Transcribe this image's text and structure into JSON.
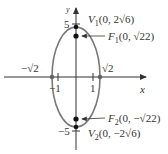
{
  "diagram": {
    "type": "ellipse",
    "equation_params": {
      "a_squared": 24,
      "b_squared": 2,
      "c_squared": 22
    },
    "axes": {
      "x_label": "x",
      "y_label": "y"
    },
    "ticks": {
      "y_pos": "5",
      "y_neg": "−5",
      "x_pos": "1",
      "x_neg": "−1"
    },
    "intercepts": {
      "x_pos": "√2",
      "x_neg": "−√2"
    },
    "labels": {
      "v1": {
        "name": "V",
        "sub": "1",
        "coords": "(0, 2√6)"
      },
      "f1": {
        "name": "F",
        "sub": "1",
        "coords": "(0, √22)"
      },
      "f2": {
        "name": "F",
        "sub": "2",
        "coords": "(0, −√22)"
      },
      "v2": {
        "name": "V",
        "sub": "2",
        "coords": "(0, −2√6)"
      }
    },
    "colors": {
      "curve": "#7a7a7a",
      "axis": "#333333",
      "point": "#111111",
      "intercept": "#666666"
    }
  }
}
